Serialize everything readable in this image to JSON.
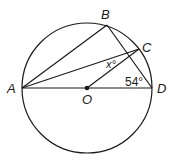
{
  "diagram": {
    "type": "circle-geometry",
    "circle": {
      "center_label": "O",
      "cx": 87,
      "cy": 88,
      "r": 65
    },
    "points": {
      "A": {
        "label": "A",
        "x": 22,
        "y": 88
      },
      "B": {
        "label": "B",
        "x": 107,
        "y": 25
      },
      "C": {
        "label": "C",
        "x": 139,
        "y": 49
      },
      "D": {
        "label": "D",
        "x": 152,
        "y": 88
      },
      "O": {
        "label": "O",
        "x": 87,
        "y": 88
      }
    },
    "segments": [
      [
        "A",
        "B"
      ],
      [
        "A",
        "C"
      ],
      [
        "A",
        "D"
      ],
      [
        "B",
        "D"
      ],
      [
        "O",
        "C"
      ]
    ],
    "angles": {
      "x": {
        "label": "x°"
      },
      "d": {
        "label": "54°"
      }
    },
    "colors": {
      "stroke": "#1a1a1a",
      "background": "#ffffff"
    }
  }
}
